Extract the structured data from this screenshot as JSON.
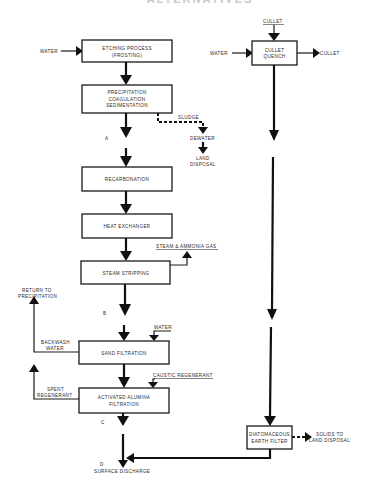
{
  "title": "ALTERNATIVES",
  "boxes": {
    "etching": [
      "ETCHING PROCESS",
      "(FROSTING)"
    ],
    "precipitation": [
      "PRECIPITATION",
      "COAGULATION",
      "SEDIMENTATION"
    ],
    "recarbonation": [
      "RECARBONATION"
    ],
    "heat_exchanger": [
      "HEAT EXCHANGER"
    ],
    "steam_stripping": [
      "STEAM STRIPPING"
    ],
    "sand_filtration": [
      "SAND FILTRATION"
    ],
    "alumina": [
      "ACTIVATED ALUMINA",
      "FILTRATION"
    ],
    "cullet_quench": [
      "CULLET",
      "QUENCH"
    ],
    "diatomaceous": [
      "DIATOMACEOUS",
      "EARTH FILTER"
    ]
  },
  "labels": {
    "water_in_etching": "WATER",
    "water_in_cullet": "WATER",
    "cullet_in": "CULLET",
    "cullet_out": "CULLET",
    "sludge": "SLUDGE",
    "dewater": "DEWATER",
    "land_disposal": [
      "LAND",
      "DISPOSAL"
    ],
    "steam_ammonia": "STEAM & AMMONIA GAS",
    "water_sand": "WATER",
    "caustic": "CAUSTIC REGENERANT",
    "return_precip": [
      "RETURN TO",
      "PRECIPITATION"
    ],
    "backwash": [
      "BACKWASH",
      "WATER"
    ],
    "spent": [
      "SPENT",
      "REGENERANT"
    ],
    "solids": [
      "SOLIDS TO",
      "LAND DISPOSAL"
    ],
    "surface_discharge": "SURFACE DISCHARGE"
  },
  "points": {
    "A": "A",
    "B": "B",
    "C": "C",
    "D": "D"
  }
}
